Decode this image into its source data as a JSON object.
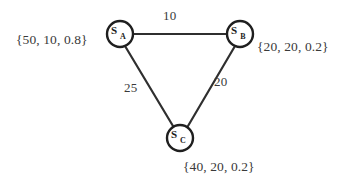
{
  "figure": {
    "background_color": "#ffffff",
    "stroke_color": "#2b2b2b",
    "node_fill_color": "#ffffff"
  },
  "graph": {
    "type": "undirected-weighted-graph",
    "nodes": [
      {
        "id": "A",
        "label_base": "S",
        "label_subscript": "A",
        "label_full": "S_A",
        "attributes_text": "{50, 10, 0.8}",
        "attributes": [
          50,
          10,
          0.8
        ],
        "x": 120,
        "y": 34,
        "r": 13
      },
      {
        "id": "B",
        "label_base": "S",
        "label_subscript": "B",
        "label_full": "S_B",
        "attributes_text": "{20, 20, 0.2}",
        "attributes": [
          20,
          20,
          0.2
        ],
        "x": 240,
        "y": 34,
        "r": 13
      },
      {
        "id": "C",
        "label_base": "S",
        "label_subscript": "C",
        "label_full": "S_C",
        "attributes_text": "{40, 20, 0.2}",
        "attributes": [
          40,
          20,
          0.2
        ],
        "x": 180,
        "y": 138,
        "r": 13
      }
    ],
    "edges": [
      {
        "id": "AB",
        "from": "A",
        "to": "B",
        "weight": 10,
        "weight_text": "10"
      },
      {
        "id": "AC",
        "from": "A",
        "to": "C",
        "weight": 25,
        "weight_text": "25"
      },
      {
        "id": "BC",
        "from": "B",
        "to": "C",
        "weight": 20,
        "weight_text": "20"
      }
    ]
  }
}
